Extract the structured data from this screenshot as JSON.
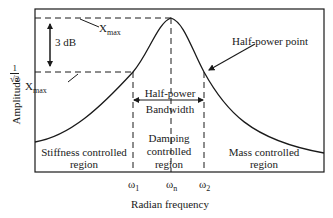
{
  "diagram": {
    "y_axis_label": "Amplitude",
    "x_axis_label": "Radian frequency",
    "annotations": {
      "three_db": "3 dB",
      "xmax_symbol": "X",
      "xmax_subscript": "max",
      "half_power_fraction_num": "1",
      "half_power_fraction_den": "√2",
      "half_power_point": "Half-power point",
      "bandwidth_line1": "Half-power",
      "bandwidth_line2": "Bandwidth"
    },
    "regions": [
      {
        "line1": "Stiffness controlled",
        "line2": "region"
      },
      {
        "line1": "Damping",
        "line2": "controlled",
        "line3": "region"
      },
      {
        "line1": "Mass controlled",
        "line2": "region"
      }
    ],
    "x_ticks": [
      {
        "symbol": "ω",
        "sub": "1"
      },
      {
        "symbol": "ω",
        "sub": "n"
      },
      {
        "symbol": "ω",
        "sub": "2"
      }
    ],
    "colors": {
      "line": "#1a1a1a",
      "background": "#ffffff"
    }
  }
}
